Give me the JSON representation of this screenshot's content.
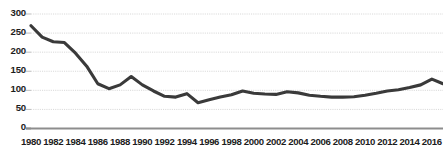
{
  "chart_data": {
    "type": "line",
    "title": "",
    "subtitle": "",
    "xlabel": "",
    "ylabel": "",
    "grid": true,
    "legend": null,
    "xlim": [
      1980,
      2017
    ],
    "ylim": [
      0,
      300
    ],
    "yticks": [
      0,
      50,
      100,
      150,
      200,
      250,
      300
    ],
    "ytick_labels": [
      "0",
      "50",
      "100",
      "150",
      "200",
      "250",
      "300"
    ],
    "xticks": [
      1980,
      1982,
      1984,
      1986,
      1988,
      1990,
      1992,
      1994,
      1996,
      1998,
      2000,
      2002,
      2004,
      2006,
      2008,
      2010,
      2012,
      2014,
      2016
    ],
    "xtick_labels": [
      "1980",
      "1982",
      "1984",
      "1986",
      "1988",
      "1990",
      "1992",
      "1994",
      "1996",
      "1998",
      "2000",
      "2002",
      "2004",
      "2006",
      "2008",
      "2010",
      "2012",
      "2014",
      "2016"
    ],
    "line_color": "#3a3a3a",
    "line_width": 3.1,
    "series": [
      {
        "name": "value",
        "x": [
          1980,
          1981,
          1982,
          1983,
          1984,
          1985,
          1986,
          1987,
          1988,
          1989,
          1990,
          1991,
          1992,
          1993,
          1994,
          1995,
          1996,
          1997,
          1998,
          1999,
          2000,
          2001,
          2002,
          2003,
          2004,
          2005,
          2006,
          2007,
          2008,
          2009,
          2010,
          2011,
          2012,
          2013,
          2014,
          2015,
          2016,
          2017
        ],
        "values": [
          268,
          238,
          226,
          224,
          196,
          162,
          116,
          103,
          113,
          135,
          113,
          97,
          83,
          81,
          90,
          66,
          74,
          81,
          87,
          97,
          91,
          89,
          88,
          95,
          92,
          86,
          83,
          81,
          81,
          82,
          86,
          91,
          97,
          100,
          106,
          113,
          128,
          116
        ]
      }
    ]
  },
  "axis": {
    "title_fragment": "· ·    ·   ·     ·"
  }
}
